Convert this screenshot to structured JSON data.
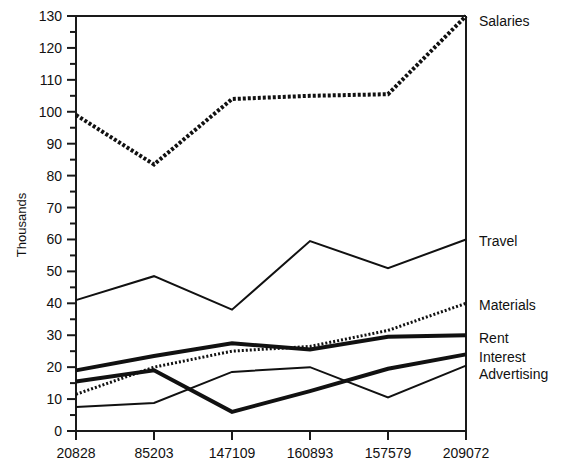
{
  "chart_data": {
    "type": "line",
    "title": "",
    "xlabel": "",
    "ylabel": "Thousands",
    "xlim": [
      0,
      5
    ],
    "ylim": [
      0,
      130
    ],
    "ytick_step": 10,
    "yminor_step": 5,
    "grid": false,
    "legend_position": "right-of-axis-endpoint",
    "categories": [
      "20828",
      "85203",
      "147109",
      "160893",
      "157579",
      "209072"
    ],
    "ytick_labels": [
      "0",
      "10",
      "20",
      "30",
      "40",
      "50",
      "60",
      "70",
      "80",
      "90",
      "100",
      "110",
      "120",
      "130"
    ],
    "series": [
      {
        "name": "Salaries",
        "style": "thick-dotted-dashed",
        "stroke_width": 4,
        "dash": "3 2",
        "values": [
          99,
          83.5,
          104,
          105,
          105.5,
          130
        ]
      },
      {
        "name": "Travel",
        "style": "thin-solid",
        "stroke_width": 2,
        "dash": "",
        "values": [
          41,
          48.5,
          38,
          59.5,
          51,
          60
        ]
      },
      {
        "name": "Materials",
        "style": "dotted",
        "stroke_width": 3,
        "dash": "2 2",
        "values": [
          11.5,
          20,
          25,
          26.5,
          31.5,
          40
        ]
      },
      {
        "name": "Rent",
        "style": "thick-solid",
        "stroke_width": 4,
        "dash": "",
        "values": [
          19,
          23.5,
          27.5,
          25.5,
          29.5,
          30
        ]
      },
      {
        "name": "Interest",
        "style": "thick-solid",
        "stroke_width": 4,
        "dash": "",
        "values": [
          15.5,
          19,
          6,
          12.5,
          19.5,
          24
        ]
      },
      {
        "name": "Advertising",
        "style": "thin-solid",
        "stroke_width": 2,
        "dash": "",
        "values": [
          7.5,
          8.8,
          18.5,
          20,
          10.5,
          20.5
        ]
      }
    ]
  },
  "colors": {
    "axis": "#1a1a1a",
    "line": "#111111",
    "background": "#ffffff"
  }
}
